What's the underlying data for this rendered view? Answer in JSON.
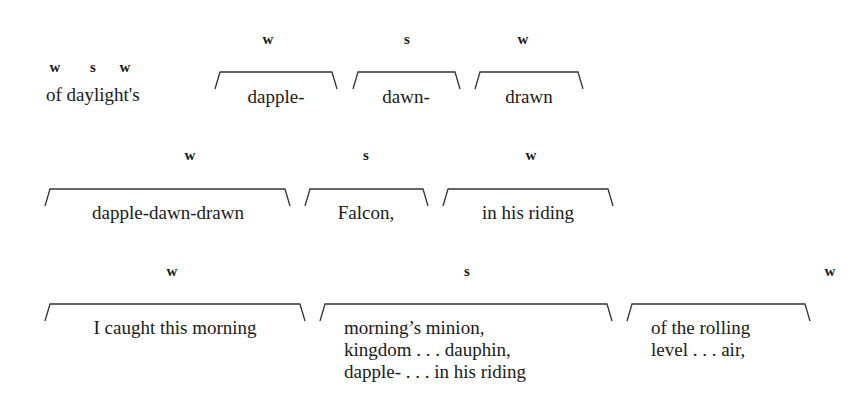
{
  "rows": [
    {
      "prefix": {
        "stress_marks": [
          "w",
          "s",
          "w"
        ],
        "text": "of daylight's"
      },
      "groups": [
        {
          "label": "w",
          "lines": [
            "dapple-"
          ],
          "x1": 215,
          "x2": 337,
          "top": 72
        },
        {
          "label": "s",
          "lines": [
            "dawn-"
          ],
          "x1": 353,
          "x2": 460,
          "top": 72
        },
        {
          "label": "w",
          "lines": [
            "drawn"
          ],
          "x1": 475,
          "x2": 583,
          "top": 72
        }
      ]
    },
    {
      "groups": [
        {
          "label": "w",
          "lines": [
            "dapple-dawn-drawn"
          ],
          "x1": 45,
          "x2": 290,
          "top": 189
        },
        {
          "label": "s",
          "lines": [
            "Falcon,"
          ],
          "x1": 305,
          "x2": 428,
          "top": 189
        },
        {
          "label": "w",
          "lines": [
            "in his riding"
          ],
          "x1": 443,
          "x2": 613,
          "top": 189
        }
      ]
    },
    {
      "groups": [
        {
          "label": "w",
          "lines": [
            "I caught this morning"
          ],
          "x1": 45,
          "x2": 305,
          "top": 304
        },
        {
          "label": "s",
          "lines": [
            "morning’s minion,",
            "kingdom . . . dauphin,",
            "dapple- . . . in his riding"
          ],
          "x1": 320,
          "x2": 612,
          "top": 304
        },
        {
          "label": "w",
          "lines": [
            "of the rolling",
            "level . . . air,"
          ],
          "x1": 627,
          "x2": 810,
          "top": 304
        }
      ]
    }
  ]
}
